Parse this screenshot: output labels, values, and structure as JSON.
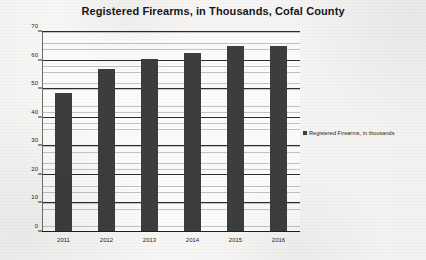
{
  "chart_data": {
    "type": "bar",
    "title": "Registered Firearms, in Thousands, Cofal County",
    "categories": [
      "2011",
      "2012",
      "2013",
      "2014",
      "2015",
      "2016"
    ],
    "values": [
      48.5,
      57,
      60.5,
      62.5,
      65,
      65
    ],
    "series": [
      {
        "name": "Registered Firearms, in thousands",
        "values": [
          48.5,
          57,
          60.5,
          62.5,
          65,
          65
        ]
      }
    ],
    "xlabel": "",
    "ylabel": "",
    "ylim": [
      0,
      70
    ],
    "y_ticks": [
      "0",
      "10",
      "20",
      "30",
      "40",
      "50",
      "60",
      "70"
    ],
    "y_tick_values": [
      0,
      10,
      20,
      30,
      40,
      50,
      60,
      70
    ],
    "y_minor_step": 2,
    "grid": true,
    "legend": {
      "position": "right",
      "entries": [
        {
          "label": "Registered Firearms, in thousands",
          "color": "#3d3d3d"
        }
      ]
    },
    "colors": {
      "bar": "#3d3d3d",
      "axis": "#1f1f1f",
      "grid_major": "#2c2c2c",
      "grid_minor": "#6e6e6e",
      "plot_background": "#fbfbfa",
      "page_background": "#f5f5f3",
      "text": "#1d1d20"
    }
  }
}
